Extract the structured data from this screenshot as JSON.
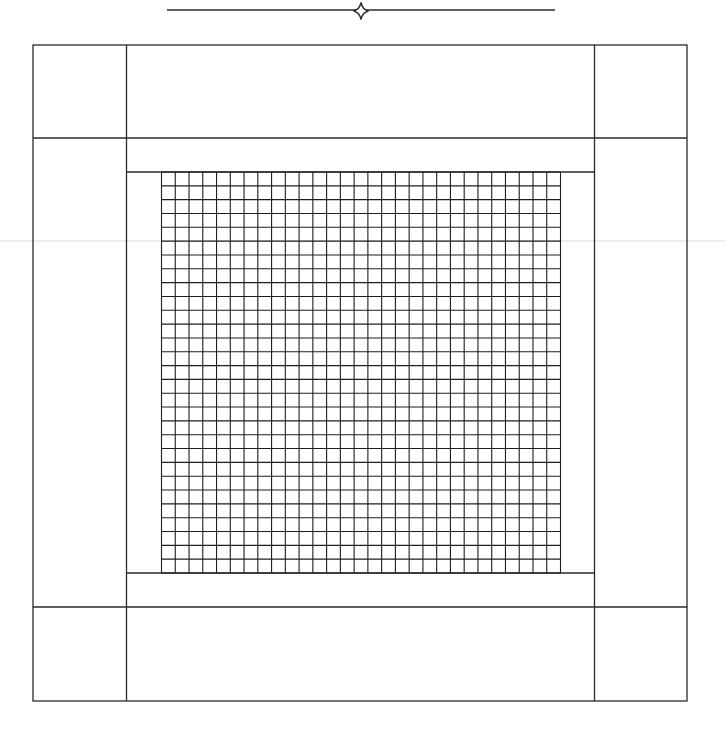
{
  "page": {
    "width": 725,
    "height": 733,
    "background": "#ffffff"
  },
  "colors": {
    "line": "#2a2a2a",
    "grid_line": "#1e1e1e",
    "scan_artifact": "#dcdcdc"
  },
  "header_ornament": {
    "icon": "four-pointed-star-icon",
    "rule": {
      "x1": 167,
      "x2": 555,
      "y": 10
    },
    "star": {
      "cx": 361,
      "cy": 11,
      "rx": 7.5,
      "ry": 8.5
    }
  },
  "frame": {
    "outer": {
      "x": 33,
      "y": 45,
      "width": 654,
      "height": 656
    },
    "vertical_dividers": [
      126.5,
      594.5
    ],
    "horizontal_dividers": [
      138,
      607
    ],
    "panels": [
      {
        "name": "corner-top-left"
      },
      {
        "name": "border-top"
      },
      {
        "name": "corner-top-right"
      },
      {
        "name": "border-left"
      },
      {
        "name": "center"
      },
      {
        "name": "border-right"
      },
      {
        "name": "corner-bottom-left"
      },
      {
        "name": "border-bottom"
      },
      {
        "name": "corner-bottom-right"
      }
    ]
  },
  "center_inner": {
    "top_line_y": 172,
    "bottom_line_y": 573,
    "x1": 126.5,
    "x2": 594.5
  },
  "grid": {
    "x": 161.5,
    "y": 172,
    "width": 399,
    "height": 401,
    "columns": 29,
    "rows": 29
  },
  "scan_artifact": {
    "y": 241
  }
}
